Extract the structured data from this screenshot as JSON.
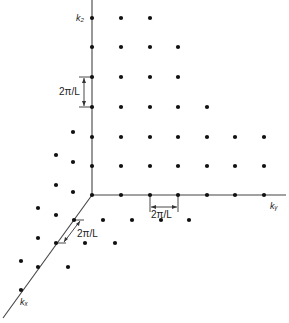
{
  "diagram": {
    "axes": {
      "kz": {
        "label": "k₂",
        "label_text": "kz"
      },
      "ky": {
        "label": "kᵧ",
        "label_text": "ky"
      },
      "kx": {
        "label": "kₓ",
        "label_text": "kx"
      }
    },
    "spacing_labels": {
      "kz": "2π/L",
      "ky": "2π/L",
      "kx": "2π/L"
    },
    "origin": [
      92,
      195
    ],
    "axis_lines": {
      "kz": [
        [
          92,
          0
        ],
        [
          92,
          195
        ]
      ],
      "ky": [
        [
          92,
          195
        ],
        [
          286,
          195
        ]
      ],
      "kx": [
        [
          92,
          195
        ],
        [
          3,
          318
        ]
      ]
    },
    "colors": {
      "ink": "#1a1a1a",
      "axis": "#444444",
      "background": "#ffffff"
    },
    "points": [
      [
        92,
        18
      ],
      [
        121,
        18
      ],
      [
        150,
        18
      ],
      [
        92,
        47
      ],
      [
        121,
        47
      ],
      [
        150,
        47
      ],
      [
        178,
        47
      ],
      [
        92,
        77
      ],
      [
        121,
        77
      ],
      [
        150,
        77
      ],
      [
        178,
        77
      ],
      [
        92,
        107
      ],
      [
        121,
        107
      ],
      [
        150,
        107
      ],
      [
        178,
        107
      ],
      [
        207,
        107
      ],
      [
        92,
        137
      ],
      [
        121,
        137
      ],
      [
        150,
        137
      ],
      [
        178,
        137
      ],
      [
        207,
        137
      ],
      [
        235,
        137
      ],
      [
        264,
        137
      ],
      [
        92,
        166
      ],
      [
        121,
        166
      ],
      [
        150,
        166
      ],
      [
        178,
        166
      ],
      [
        207,
        166
      ],
      [
        235,
        166
      ],
      [
        264,
        166
      ],
      [
        92,
        195
      ],
      [
        121,
        195
      ],
      [
        150,
        195
      ],
      [
        178,
        195
      ],
      [
        207,
        195
      ],
      [
        235,
        195
      ],
      [
        264,
        195
      ],
      [
        73,
        132
      ],
      [
        56,
        155
      ],
      [
        73,
        162
      ],
      [
        56,
        185
      ],
      [
        73,
        192
      ],
      [
        38,
        208
      ],
      [
        56,
        215
      ],
      [
        74,
        220
      ],
      [
        103,
        220
      ],
      [
        132,
        220
      ],
      [
        161,
        220
      ],
      [
        189,
        220
      ],
      [
        38,
        238
      ],
      [
        56,
        243
      ],
      [
        85,
        243
      ],
      [
        115,
        243
      ],
      [
        21,
        261
      ],
      [
        38,
        267
      ],
      [
        68,
        267
      ],
      [
        21,
        290
      ]
    ]
  }
}
